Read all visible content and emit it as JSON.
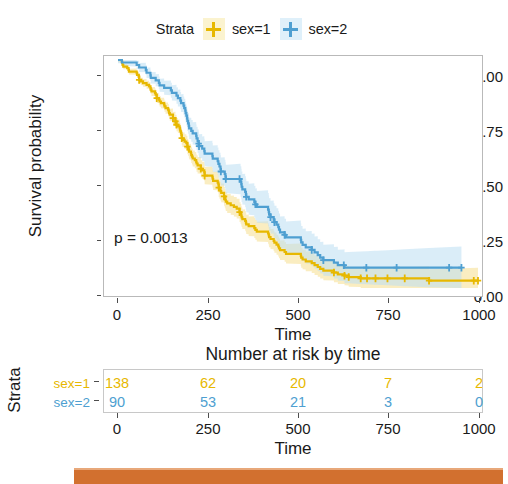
{
  "legend": {
    "title": "Strata",
    "entries": [
      {
        "label": "sex=1",
        "color": "#E7B800",
        "key_icon": "plus-marker-icon"
      },
      {
        "label": "sex=2",
        "color": "#4E9FD1",
        "key_icon": "plus-marker-icon"
      }
    ]
  },
  "plot": {
    "ylabel": "Survival probability",
    "xlabel": "Time",
    "ytick_labels": [
      "1.00",
      "0.75",
      "0.50",
      "0.25",
      "0.00"
    ],
    "xtick_labels": [
      "0",
      "250",
      "500",
      "750",
      "1000"
    ],
    "annotation": "p = 0.0013"
  },
  "risk_table": {
    "title": "Number at risk by time",
    "strata_axis_label": "Strata",
    "xlabel": "Time",
    "xtick_labels": [
      "0",
      "250",
      "500",
      "750",
      "1000"
    ],
    "rows": [
      {
        "label": "sex=1",
        "color": "#E7B800",
        "values": [
          "138",
          "62",
          "20",
          "7",
          "2"
        ]
      },
      {
        "label": "sex=2",
        "color": "#4E9FD1",
        "values": [
          "90",
          "53",
          "21",
          "3",
          "0"
        ]
      }
    ]
  },
  "colors": {
    "strata_1": "#E7B800",
    "strata_1_band": "#F2D87A",
    "strata_2": "#4E9FD1",
    "strata_2_band": "#AFD8EF",
    "panel_border": "#b9b9b9",
    "accent_bar": "#d2702f"
  },
  "chart_data": {
    "type": "line",
    "title": "",
    "xlabel": "Time",
    "ylabel": "Survival probability",
    "xlim": [
      0,
      1022
    ],
    "ylim": [
      0,
      1
    ],
    "grid": false,
    "legend_position": "top-center",
    "legend_title": "Strata",
    "annotations": [
      "p = 0.0013"
    ],
    "series": [
      {
        "name": "sex=1",
        "color": "#E7B800",
        "points": [
          [
            0,
            1.0
          ],
          [
            11,
            0.993
          ],
          [
            12,
            0.986
          ],
          [
            13,
            0.978
          ],
          [
            15,
            0.971
          ],
          [
            26,
            0.964
          ],
          [
            30,
            0.957
          ],
          [
            31,
            0.949
          ],
          [
            53,
            0.942
          ],
          [
            54,
            0.935
          ],
          [
            59,
            0.928
          ],
          [
            60,
            0.913
          ],
          [
            65,
            0.906
          ],
          [
            71,
            0.899
          ],
          [
            81,
            0.891
          ],
          [
            88,
            0.884
          ],
          [
            92,
            0.877
          ],
          [
            93,
            0.87
          ],
          [
            95,
            0.862
          ],
          [
            105,
            0.855
          ],
          [
            107,
            0.848
          ],
          [
            110,
            0.833
          ],
          [
            116,
            0.826
          ],
          [
            118,
            0.818
          ],
          [
            122,
            0.811
          ],
          [
            131,
            0.804
          ],
          [
            132,
            0.797
          ],
          [
            135,
            0.789
          ],
          [
            142,
            0.782
          ],
          [
            144,
            0.775
          ],
          [
            145,
            0.767
          ],
          [
            147,
            0.76
          ],
          [
            156,
            0.745
          ],
          [
            163,
            0.731
          ],
          [
            166,
            0.716
          ],
          [
            170,
            0.709
          ],
          [
            175,
            0.701
          ],
          [
            176,
            0.694
          ],
          [
            177,
            0.687
          ],
          [
            179,
            0.679
          ],
          [
            180,
            0.672
          ],
          [
            181,
            0.657
          ],
          [
            183,
            0.65
          ],
          [
            189,
            0.642
          ],
          [
            194,
            0.635
          ],
          [
            197,
            0.62
          ],
          [
            199,
            0.613
          ],
          [
            201,
            0.605
          ],
          [
            202,
            0.598
          ],
          [
            207,
            0.591
          ],
          [
            208,
            0.583
          ],
          [
            210,
            0.576
          ],
          [
            212,
            0.568
          ],
          [
            218,
            0.561
          ],
          [
            222,
            0.553
          ],
          [
            223,
            0.546
          ],
          [
            226,
            0.538
          ],
          [
            235,
            0.523
          ],
          [
            239,
            0.516
          ],
          [
            245,
            0.508
          ],
          [
            246,
            0.493
          ],
          [
            268,
            0.485
          ],
          [
            269,
            0.478
          ],
          [
            270,
            0.47
          ],
          [
            283,
            0.462
          ],
          [
            285,
            0.455
          ],
          [
            286,
            0.44
          ],
          [
            288,
            0.432
          ],
          [
            291,
            0.425
          ],
          [
            293,
            0.417
          ],
          [
            301,
            0.402
          ],
          [
            303,
            0.394
          ],
          [
            305,
            0.386
          ],
          [
            306,
            0.379
          ],
          [
            310,
            0.371
          ],
          [
            320,
            0.363
          ],
          [
            329,
            0.356
          ],
          [
            337,
            0.348
          ],
          [
            345,
            0.333
          ],
          [
            348,
            0.325
          ],
          [
            350,
            0.317
          ],
          [
            351,
            0.31
          ],
          [
            353,
            0.302
          ],
          [
            361,
            0.294
          ],
          [
            363,
            0.287
          ],
          [
            364,
            0.279
          ],
          [
            371,
            0.271
          ],
          [
            387,
            0.263
          ],
          [
            390,
            0.255
          ],
          [
            394,
            0.247
          ],
          [
            426,
            0.239
          ],
          [
            428,
            0.231
          ],
          [
            429,
            0.223
          ],
          [
            433,
            0.215
          ],
          [
            442,
            0.207
          ],
          [
            444,
            0.199
          ],
          [
            450,
            0.19
          ],
          [
            455,
            0.182
          ],
          [
            457,
            0.174
          ],
          [
            460,
            0.166
          ],
          [
            473,
            0.158
          ],
          [
            477,
            0.15
          ],
          [
            519,
            0.141
          ],
          [
            520,
            0.133
          ],
          [
            524,
            0.125
          ],
          [
            533,
            0.117
          ],
          [
            550,
            0.109
          ],
          [
            558,
            0.1
          ],
          [
            567,
            0.092
          ],
          [
            574,
            0.084
          ],
          [
            583,
            0.076
          ],
          [
            613,
            0.068
          ],
          [
            624,
            0.06
          ],
          [
            641,
            0.06
          ],
          [
            643,
            0.054
          ],
          [
            654,
            0.054
          ],
          [
            655,
            0.048
          ],
          [
            687,
            0.048
          ],
          [
            689,
            0.042
          ],
          [
            705,
            0.042
          ],
          [
            707,
            0.042
          ],
          [
            728,
            0.042
          ],
          [
            731,
            0.042
          ],
          [
            735,
            0.042
          ],
          [
            765,
            0.042
          ],
          [
            791,
            0.042
          ],
          [
            814,
            0.042
          ],
          [
            883,
            0.032
          ],
          [
            1022,
            0.032
          ]
        ],
        "censored": [
          [
            60,
            0.913
          ],
          [
            110,
            0.833
          ],
          [
            156,
            0.745
          ],
          [
            163,
            0.731
          ],
          [
            166,
            0.716
          ],
          [
            181,
            0.657
          ],
          [
            197,
            0.62
          ],
          [
            235,
            0.523
          ],
          [
            246,
            0.493
          ],
          [
            286,
            0.44
          ],
          [
            301,
            0.402
          ],
          [
            345,
            0.333
          ],
          [
            613,
            0.068
          ],
          [
            643,
            0.054
          ],
          [
            655,
            0.048
          ],
          [
            689,
            0.042
          ],
          [
            707,
            0.042
          ],
          [
            731,
            0.042
          ],
          [
            765,
            0.042
          ],
          [
            814,
            0.042
          ],
          [
            883,
            0.032
          ],
          [
            1010,
            0.032
          ],
          [
            1022,
            0.032
          ]
        ]
      },
      {
        "name": "sex=2",
        "color": "#4E9FD1",
        "points": [
          [
            0,
            1.0
          ],
          [
            5,
            1.0
          ],
          [
            11,
            0.989
          ],
          [
            53,
            0.978
          ],
          [
            60,
            0.967
          ],
          [
            79,
            0.956
          ],
          [
            81,
            0.944
          ],
          [
            92,
            0.933
          ],
          [
            93,
            0.922
          ],
          [
            107,
            0.911
          ],
          [
            116,
            0.9
          ],
          [
            118,
            0.889
          ],
          [
            131,
            0.878
          ],
          [
            150,
            0.867
          ],
          [
            153,
            0.856
          ],
          [
            166,
            0.844
          ],
          [
            170,
            0.833
          ],
          [
            177,
            0.822
          ],
          [
            179,
            0.811
          ],
          [
            186,
            0.8
          ],
          [
            188,
            0.789
          ],
          [
            191,
            0.778
          ],
          [
            192,
            0.767
          ],
          [
            194,
            0.756
          ],
          [
            196,
            0.744
          ],
          [
            197,
            0.733
          ],
          [
            199,
            0.722
          ],
          [
            201,
            0.711
          ],
          [
            202,
            0.7
          ],
          [
            208,
            0.689
          ],
          [
            212,
            0.678
          ],
          [
            222,
            0.667
          ],
          [
            223,
            0.656
          ],
          [
            226,
            0.644
          ],
          [
            229,
            0.633
          ],
          [
            230,
            0.622
          ],
          [
            239,
            0.611
          ],
          [
            245,
            0.6
          ],
          [
            246,
            0.589
          ],
          [
            268,
            0.578
          ],
          [
            269,
            0.567
          ],
          [
            283,
            0.556
          ],
          [
            285,
            0.544
          ],
          [
            288,
            0.533
          ],
          [
            291,
            0.522
          ],
          [
            292,
            0.511
          ],
          [
            303,
            0.5
          ],
          [
            305,
            0.489
          ],
          [
            306,
            0.478
          ],
          [
            310,
            0.478
          ],
          [
            320,
            0.478
          ],
          [
            329,
            0.478
          ],
          [
            337,
            0.478
          ],
          [
            345,
            0.478
          ],
          [
            348,
            0.467
          ],
          [
            350,
            0.456
          ],
          [
            351,
            0.444
          ],
          [
            353,
            0.433
          ],
          [
            361,
            0.422
          ],
          [
            363,
            0.411
          ],
          [
            364,
            0.4
          ],
          [
            371,
            0.389
          ],
          [
            387,
            0.378
          ],
          [
            390,
            0.367
          ],
          [
            394,
            0.356
          ],
          [
            426,
            0.344
          ],
          [
            428,
            0.333
          ],
          [
            429,
            0.322
          ],
          [
            433,
            0.311
          ],
          [
            442,
            0.3
          ],
          [
            444,
            0.289
          ],
          [
            450,
            0.278
          ],
          [
            455,
            0.267
          ],
          [
            457,
            0.256
          ],
          [
            460,
            0.244
          ],
          [
            473,
            0.233
          ],
          [
            477,
            0.222
          ],
          [
            519,
            0.211
          ],
          [
            520,
            0.2
          ],
          [
            524,
            0.189
          ],
          [
            533,
            0.178
          ],
          [
            550,
            0.167
          ],
          [
            558,
            0.156
          ],
          [
            567,
            0.144
          ],
          [
            574,
            0.133
          ],
          [
            583,
            0.122
          ],
          [
            613,
            0.111
          ],
          [
            624,
            0.1
          ],
          [
            641,
            0.1
          ],
          [
            643,
            0.089
          ],
          [
            654,
            0.089
          ],
          [
            655,
            0.089
          ],
          [
            687,
            0.089
          ],
          [
            689,
            0.089
          ],
          [
            705,
            0.089
          ],
          [
            707,
            0.089
          ],
          [
            728,
            0.089
          ],
          [
            731,
            0.089
          ],
          [
            735,
            0.089
          ],
          [
            765,
            0.089
          ],
          [
            791,
            0.089
          ],
          [
            814,
            0.089
          ],
          [
            883,
            0.089
          ],
          [
            975,
            0.089
          ]
        ],
        "censored": [
          [
            229,
            0.633
          ],
          [
            230,
            0.622
          ],
          [
            292,
            0.511
          ],
          [
            306,
            0.478
          ],
          [
            345,
            0.478
          ],
          [
            364,
            0.4
          ],
          [
            390,
            0.367
          ],
          [
            433,
            0.311
          ],
          [
            444,
            0.289
          ],
          [
            473,
            0.233
          ],
          [
            550,
            0.167
          ],
          [
            583,
            0.122
          ],
          [
            641,
            0.1
          ],
          [
            705,
            0.089
          ],
          [
            791,
            0.089
          ],
          [
            940,
            0.089
          ],
          [
            975,
            0.089
          ]
        ]
      }
    ]
  },
  "risk_chart_data": {
    "type": "table",
    "title": "Number at risk by time",
    "columns": [
      "0",
      "250",
      "500",
      "750",
      "1000"
    ],
    "rows": [
      {
        "name": "sex=1",
        "values": [
          138,
          62,
          20,
          7,
          2
        ]
      },
      {
        "name": "sex=2",
        "values": [
          90,
          53,
          21,
          3,
          0
        ]
      }
    ]
  }
}
